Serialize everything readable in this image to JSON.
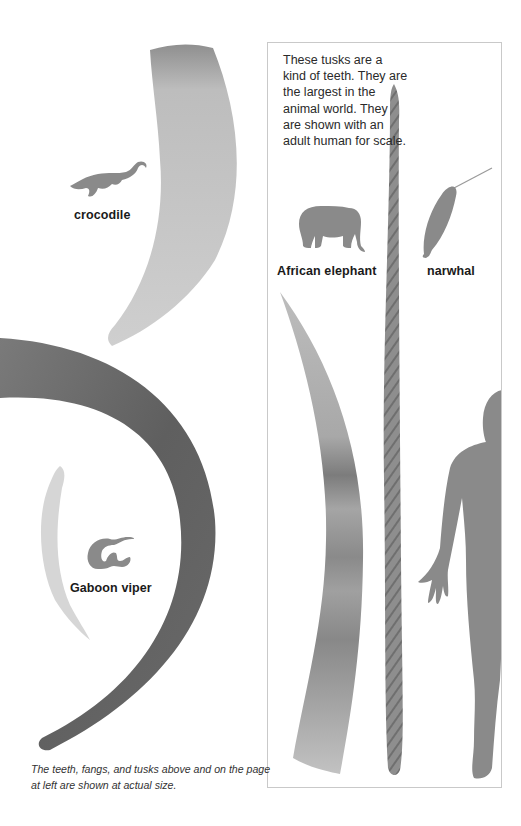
{
  "page": {
    "intro_text": "These tusks are a kind of teeth. They are the largest in the animal world. They are shown with an adult human for scale.",
    "caption": "The teeth, fangs, and tusks above and on the page at left are shown at actual size."
  },
  "specimens": [
    {
      "animal": "crocodile",
      "label": "crocodile",
      "item": "tooth",
      "icon": "crocodile-silhouette-icon"
    },
    {
      "animal": "gaboon-viper",
      "label": "Gaboon viper",
      "item": "fang",
      "icon": "snake-silhouette-icon"
    },
    {
      "animal": "african-elephant",
      "label": "African elephant",
      "item": "tusk",
      "icon": "elephant-silhouette-icon"
    },
    {
      "animal": "narwhal",
      "label": "narwhal",
      "item": "tusk",
      "icon": "narwhal-silhouette-icon"
    }
  ],
  "scale_reference": {
    "label": "adult human",
    "icon": "human-silhouette-icon"
  },
  "colors": {
    "silhouette": "#8a8a8a",
    "croc_tooth": "#c4c4c4",
    "large_tusk": "#6e6e6e",
    "box_border": "#c9c9c9",
    "text": "#1e1e1e"
  }
}
